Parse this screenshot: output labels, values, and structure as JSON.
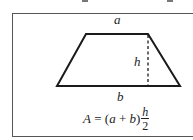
{
  "diagram": {
    "labels": {
      "top_side": "a",
      "bottom_side": "b",
      "height": "h"
    },
    "formula": {
      "lhs": "A",
      "equals": " = ",
      "open_paren": "(",
      "var_a": "a",
      "plus": " + ",
      "var_b": "b",
      "close_paren": ")",
      "numerator": "h",
      "denominator": "2"
    },
    "shape": {
      "type": "trapezoid",
      "top_left": [
        86,
        34
      ],
      "top_right": [
        148,
        34
      ],
      "bottom_right": [
        180,
        86
      ],
      "bottom_left": [
        57,
        86
      ],
      "height_line_x": 148
    },
    "colors": {
      "stroke": "#1a1a1a",
      "frame": "#555555",
      "text": "#222222"
    }
  }
}
